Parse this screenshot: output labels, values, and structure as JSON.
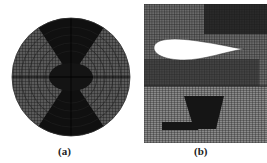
{
  "figure": {
    "panels": [
      {
        "id": "a",
        "label": "(a)",
        "description": "circular radial mesh grid"
      },
      {
        "id": "b",
        "label": "(b)",
        "description": "airfoil mesh with structured lower grid"
      }
    ],
    "colors": {
      "mesh_dark": "#111111",
      "mesh_mid": "#555555",
      "background": "#ffffff"
    }
  }
}
